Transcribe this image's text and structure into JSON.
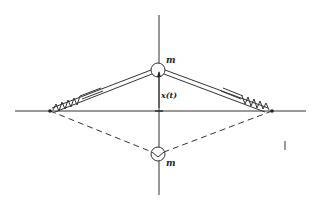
{
  "diagram": {
    "type": "mechanical-physics-diagram",
    "labels": {
      "mass_top": "m",
      "mass_bottom": "m",
      "displacement": "x(t)",
      "side_mark": "l"
    },
    "colors": {
      "line": "#333333",
      "background": "#ffffff"
    },
    "geometry": {
      "vertical_axis_x": 159,
      "horizontal_axis_y": 111,
      "left_pivot": [
        50,
        111
      ],
      "right_pivot": [
        272,
        111
      ],
      "top_mass_center": [
        158,
        70
      ],
      "bottom_mass_center": [
        158,
        154
      ],
      "mass_radius": 7
    }
  }
}
